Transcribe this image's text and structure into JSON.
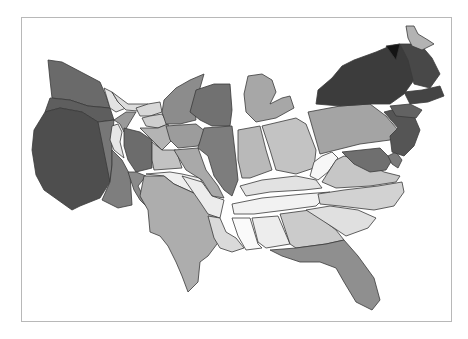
{
  "map": {
    "type": "cartogram",
    "region": "contiguous-united-states",
    "palette": "grayscale",
    "frame": {
      "border_color": "#b8b8b8"
    },
    "states": [
      {
        "id": "washington",
        "fill": "#6a6a6a"
      },
      {
        "id": "oregon",
        "fill": "#5e5e5e"
      },
      {
        "id": "california",
        "fill": "#4e4e4e"
      },
      {
        "id": "nevada",
        "fill": "#777777"
      },
      {
        "id": "idaho",
        "fill": "#e3e3e3"
      },
      {
        "id": "montana",
        "fill": "#dcdcdc"
      },
      {
        "id": "wyoming",
        "fill": "#9a9a9a"
      },
      {
        "id": "utah",
        "fill": "#e6e6e6"
      },
      {
        "id": "colorado",
        "fill": "#6c6c6c"
      },
      {
        "id": "arizona",
        "fill": "#7e7e7e"
      },
      {
        "id": "new-mexico",
        "fill": "#8a8a8a"
      },
      {
        "id": "north-dakota",
        "fill": "#d8d8d8"
      },
      {
        "id": "south-dakota",
        "fill": "#cfcfcf"
      },
      {
        "id": "nebraska",
        "fill": "#b4b4b4"
      },
      {
        "id": "kansas",
        "fill": "#c2c2c2"
      },
      {
        "id": "oklahoma",
        "fill": "#efefef"
      },
      {
        "id": "texas",
        "fill": "#adadad"
      },
      {
        "id": "minnesota",
        "fill": "#8c8c8c"
      },
      {
        "id": "iowa",
        "fill": "#9c9c9c"
      },
      {
        "id": "missouri",
        "fill": "#a9a9a9"
      },
      {
        "id": "arkansas",
        "fill": "#ececec"
      },
      {
        "id": "louisiana",
        "fill": "#dadada"
      },
      {
        "id": "wisconsin",
        "fill": "#717171"
      },
      {
        "id": "illinois",
        "fill": "#7d7d7d"
      },
      {
        "id": "michigan",
        "fill": "#a7a7a7"
      },
      {
        "id": "indiana",
        "fill": "#b9b9b9"
      },
      {
        "id": "ohio",
        "fill": "#c3c3c3"
      },
      {
        "id": "kentucky",
        "fill": "#e2e2e2"
      },
      {
        "id": "tennessee",
        "fill": "#f2f2f2"
      },
      {
        "id": "mississippi",
        "fill": "#fafafa"
      },
      {
        "id": "alabama",
        "fill": "#ededed"
      },
      {
        "id": "georgia",
        "fill": "#cbcbcb"
      },
      {
        "id": "florida",
        "fill": "#8f8f8f"
      },
      {
        "id": "south-carolina",
        "fill": "#e0e0e0"
      },
      {
        "id": "north-carolina",
        "fill": "#d2d2d2"
      },
      {
        "id": "virginia",
        "fill": "#c6c6c6"
      },
      {
        "id": "west-virginia",
        "fill": "#f7f7f7"
      },
      {
        "id": "pennsylvania",
        "fill": "#a4a4a4"
      },
      {
        "id": "maryland",
        "fill": "#6f6f6f"
      },
      {
        "id": "delaware",
        "fill": "#7b7b7b"
      },
      {
        "id": "new-jersey",
        "fill": "#555555"
      },
      {
        "id": "new-york",
        "fill": "#3c3c3c"
      },
      {
        "id": "connecticut",
        "fill": "#626262"
      },
      {
        "id": "massachusetts",
        "fill": "#444444"
      },
      {
        "id": "vermont",
        "fill": "#141414"
      },
      {
        "id": "new-hampshire",
        "fill": "#484848"
      },
      {
        "id": "maine",
        "fill": "#b3b3b3"
      }
    ]
  }
}
